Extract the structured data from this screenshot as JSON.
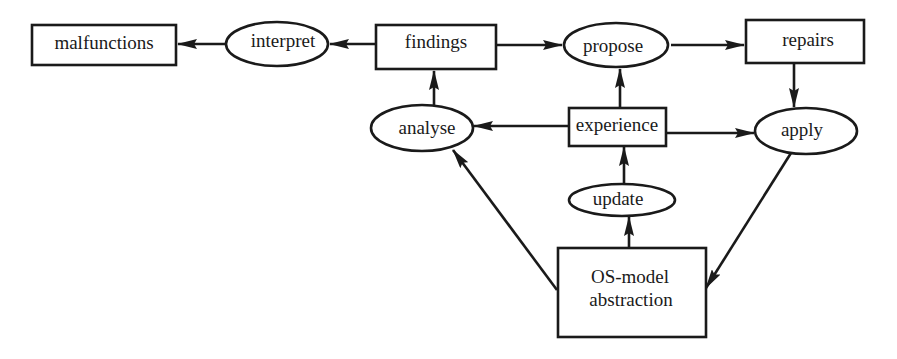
{
  "diagram": {
    "colors": {
      "stroke": "#1a1a1a",
      "fill": "#ffffff",
      "background": "#ffffff"
    },
    "nodes": {
      "malfunctions": {
        "label": "malfunctions",
        "shape": "rectangle"
      },
      "interpret": {
        "label": "interpret",
        "shape": "ellipse"
      },
      "findings": {
        "label": "findings",
        "shape": "rectangle"
      },
      "propose": {
        "label": "propose",
        "shape": "ellipse"
      },
      "repairs": {
        "label": "repairs",
        "shape": "rectangle"
      },
      "analyse": {
        "label": "analyse",
        "shape": "ellipse"
      },
      "experience": {
        "label": "experience",
        "shape": "rectangle"
      },
      "apply": {
        "label": "apply",
        "shape": "ellipse"
      },
      "update": {
        "label": "update",
        "shape": "ellipse"
      },
      "os_model": {
        "label_line1": "OS-model",
        "label_line2": "abstraction",
        "shape": "rectangle"
      }
    },
    "edges": [
      {
        "from": "interpret",
        "to": "malfunctions"
      },
      {
        "from": "findings",
        "to": "interpret"
      },
      {
        "from": "findings",
        "to": "propose"
      },
      {
        "from": "propose",
        "to": "repairs"
      },
      {
        "from": "repairs",
        "to": "apply"
      },
      {
        "from": "analyse",
        "to": "findings"
      },
      {
        "from": "experience",
        "to": "propose"
      },
      {
        "from": "experience",
        "to": "analyse"
      },
      {
        "from": "experience",
        "to": "apply"
      },
      {
        "from": "update",
        "to": "experience"
      },
      {
        "from": "os_model",
        "to": "update"
      },
      {
        "from": "os_model",
        "to": "analyse"
      },
      {
        "from": "apply",
        "to": "os_model"
      }
    ]
  }
}
